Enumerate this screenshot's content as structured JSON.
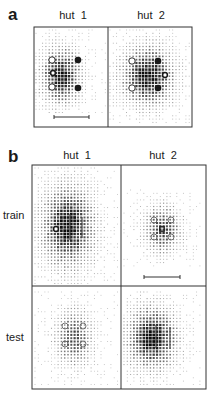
{
  "figure": {
    "panel_a": {
      "letter": "a",
      "columns": [
        "hut  1",
        "hut  2"
      ],
      "box": {
        "x": 34,
        "y": 27,
        "w": 158,
        "h": 100,
        "divider_x": 108
      },
      "cells": [
        {
          "name": "a-hut1",
          "cloud": {
            "cx": 61,
            "cy": 76,
            "sx": 13,
            "sy": 18,
            "peak": 0.95,
            "x0": 36,
            "x1": 106,
            "y0": 30,
            "y1": 114
          },
          "markers": [
            {
              "type": "open-circle",
              "x": 52,
              "y": 60,
              "r": 3.2
            },
            {
              "type": "open-circle-bold",
              "x": 53,
              "y": 73,
              "r": 2.4
            },
            {
              "type": "open-circle",
              "x": 52,
              "y": 87,
              "r": 3.2
            },
            {
              "type": "filled-circle",
              "x": 78,
              "y": 60,
              "r": 3.3
            },
            {
              "type": "filled-circle",
              "x": 78,
              "y": 88,
              "r": 3.3
            }
          ],
          "scale_bar": {
            "x1": 54,
            "x2": 89,
            "y": 117
          }
        },
        {
          "name": "a-hut2",
          "cloud": {
            "cx": 148,
            "cy": 76,
            "sx": 17,
            "sy": 19,
            "peak": 1.0,
            "x0": 110,
            "x1": 190,
            "y0": 30,
            "y1": 124
          },
          "markers": [
            {
              "type": "open-circle",
              "x": 132,
              "y": 61,
              "r": 3.2
            },
            {
              "type": "open-circle",
              "x": 132,
              "y": 88,
              "r": 3.2
            },
            {
              "type": "filled-circle",
              "x": 158,
              "y": 61,
              "r": 3.3
            },
            {
              "type": "filled-circle",
              "x": 158,
              "y": 88,
              "r": 3.3
            },
            {
              "type": "open-circle-bold",
              "x": 165,
              "y": 75,
              "r": 2.4
            }
          ]
        }
      ]
    },
    "panel_b": {
      "letter": "b",
      "columns": [
        "hut  1",
        "hut  2"
      ],
      "rows": [
        "train",
        "test"
      ],
      "box": {
        "x": 32,
        "y": 165,
        "w": 174,
        "h": 224,
        "divider_x": 121,
        "divider_y": 286
      },
      "cells": [
        {
          "name": "b-train-hut1",
          "cloud": {
            "cx": 68,
            "cy": 226,
            "sx": 17,
            "sy": 26,
            "peak": 1.0,
            "x0": 35,
            "x1": 119,
            "y0": 168,
            "y1": 284
          },
          "markers": [
            {
              "type": "open-circle-bold",
              "x": 56,
              "y": 229,
              "r": 2.4
            }
          ],
          "lines": [
            {
              "x": 70,
              "y1": 214,
              "y2": 240
            },
            {
              "x": 82,
              "y1": 217,
              "y2": 238
            }
          ]
        },
        {
          "name": "b-train-hut2",
          "cloud": {
            "cx": 162,
            "cy": 229,
            "sx": 12,
            "sy": 15,
            "peak": 0.75,
            "x0": 124,
            "x1": 203,
            "y0": 190,
            "y1": 268
          },
          "markers": [
            {
              "type": "open-circle-gray",
              "x": 154,
              "y": 220,
              "r": 3.0
            },
            {
              "type": "open-circle-gray",
              "x": 171,
              "y": 220,
              "r": 3.0
            },
            {
              "type": "open-circle-gray",
              "x": 154,
              "y": 237,
              "r": 3.0
            },
            {
              "type": "open-circle-gray",
              "x": 171,
              "y": 237,
              "r": 3.0
            },
            {
              "type": "square",
              "x": 162,
              "y": 229,
              "r": 2.2
            }
          ],
          "scale_bar": {
            "x1": 144,
            "x2": 180,
            "y": 277
          }
        },
        {
          "name": "b-test-hut1",
          "cloud": {
            "cx": 74,
            "cy": 338,
            "sx": 12,
            "sy": 18,
            "peak": 0.7,
            "x0": 35,
            "x1": 119,
            "y0": 292,
            "y1": 386
          },
          "markers": [
            {
              "type": "open-circle-gray",
              "x": 65,
              "y": 326,
              "r": 3.0
            },
            {
              "type": "open-circle-gray",
              "x": 83,
              "y": 326,
              "r": 3.0
            },
            {
              "type": "open-circle-gray",
              "x": 65,
              "y": 344,
              "r": 3.0
            },
            {
              "type": "open-circle-gray",
              "x": 83,
              "y": 344,
              "r": 3.0
            }
          ]
        },
        {
          "name": "b-test-hut2",
          "cloud": {
            "cx": 152,
            "cy": 338,
            "sx": 16,
            "sy": 20,
            "peak": 1.0,
            "x0": 124,
            "x1": 203,
            "y0": 292,
            "y1": 386
          },
          "markers": [],
          "lines": [
            {
              "x": 156,
              "y1": 325,
              "y2": 348
            },
            {
              "x": 170,
              "y1": 327,
              "y2": 349
            }
          ]
        }
      ]
    },
    "grid_spacing": 3.3,
    "colors": {
      "ink": "#1a1a1a",
      "gray_marker": "#666666",
      "frame": "#333333"
    }
  }
}
